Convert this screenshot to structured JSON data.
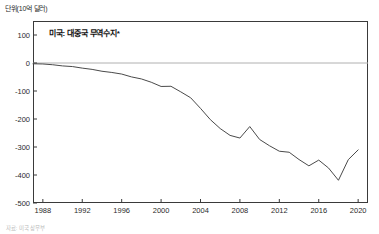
{
  "unit_label": "단위(10억 달러)",
  "footnote": "자료: 미국 상무부",
  "chart_data": {
    "type": "line",
    "title": "미국: 대중국 무역수지*",
    "xlabel": "",
    "ylabel": "단위(10억 달러)",
    "xlim": [
      1987,
      2021
    ],
    "ylim": [
      -500,
      150
    ],
    "grid": false,
    "legend": "none",
    "zero_line": true,
    "y_ticks": [
      100,
      0,
      -100,
      -200,
      -300,
      -400,
      -500
    ],
    "y_tick_labels": [
      "100",
      "0",
      "-100",
      "-200",
      "-300",
      "-400",
      "-500"
    ],
    "x_ticks": [
      1988,
      1992,
      1996,
      2000,
      2004,
      2008,
      2012,
      2016,
      2020
    ],
    "x_tick_labels": [
      "1988",
      "1992",
      "1996",
      "2000",
      "2004",
      "2008",
      "2012",
      "2016",
      "2020"
    ],
    "line_color": "#4a4a4a",
    "series": [
      {
        "name": "미국: 대중국 무역수지",
        "x": [
          1987,
          1988,
          1989,
          1990,
          1991,
          1992,
          1993,
          1994,
          1995,
          1996,
          1997,
          1998,
          1999,
          2000,
          2001,
          2002,
          2003,
          2004,
          2005,
          2006,
          2007,
          2008,
          2009,
          2010,
          2011,
          2012,
          2013,
          2014,
          2015,
          2016,
          2017,
          2018,
          2019,
          2020
        ],
        "values": [
          -2.8,
          -3.5,
          -6.2,
          -10.4,
          -12.7,
          -18.3,
          -22.8,
          -29.5,
          -33.8,
          -39.5,
          -49.7,
          -56.9,
          -68.7,
          -83.8,
          -83.1,
          -103.1,
          -124.1,
          -162.0,
          -202.3,
          -234.1,
          -258.5,
          -268.0,
          -227.0,
          -273.1,
          -295.5,
          -315.1,
          -318.7,
          -344.8,
          -367.3,
          -346.8,
          -375.2,
          -418.9,
          -345.2,
          -310.3
        ]
      }
    ]
  }
}
